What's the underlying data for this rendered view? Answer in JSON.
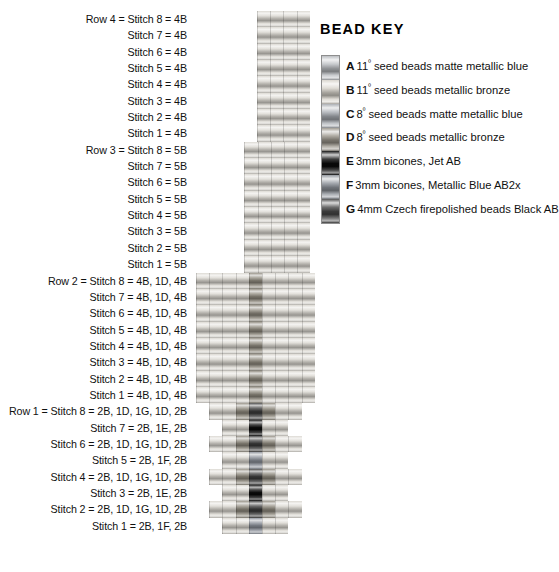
{
  "pattern": {
    "rows": [
      {
        "row_label": "Row 4",
        "stitches": [
          "Row 4 = Stitch 8 = 4B",
          "Stitch 7 = 4B",
          "Stitch 6 = 4B",
          "Stitch 5 = 4B",
          "Stitch 4 = 4B",
          "Stitch 3 = 4B",
          "Stitch 2 = 4B",
          "Stitch 1 = 4B"
        ],
        "cells": [
          [
            "B",
            "B",
            "B",
            "B"
          ],
          [
            "B",
            "B",
            "B",
            "B"
          ],
          [
            "B",
            "B",
            "B",
            "B"
          ],
          [
            "B",
            "B",
            "B",
            "B"
          ],
          [
            "B",
            "B",
            "B",
            "B"
          ],
          [
            "B",
            "B",
            "B",
            "B"
          ],
          [
            "B",
            "B",
            "B",
            "B"
          ],
          [
            "B",
            "B",
            "B",
            "B"
          ]
        ],
        "indent": 28
      },
      {
        "row_label": "Row 3",
        "stitches": [
          "Row 3 = Stitch 8 = 5B",
          "Stitch 7 = 5B",
          "Stitch 6 = 5B",
          "Stitch 5 = 5B",
          "Stitch 4 = 5B",
          "Stitch 3 = 5B",
          "Stitch 2 = 5B",
          "Stitch 1 = 5B"
        ],
        "cells": [
          [
            "B",
            "B",
            "B",
            "B",
            "B"
          ],
          [
            "B",
            "B",
            "B",
            "B",
            "B"
          ],
          [
            "B",
            "B",
            "B",
            "B",
            "B"
          ],
          [
            "B",
            "B",
            "B",
            "B",
            "B"
          ],
          [
            "B",
            "B",
            "B",
            "B",
            "B"
          ],
          [
            "B",
            "B",
            "B",
            "B",
            "B"
          ],
          [
            "B",
            "B",
            "B",
            "B",
            "B"
          ],
          [
            "B",
            "B",
            "B",
            "B",
            "B"
          ]
        ],
        "indent": 22
      },
      {
        "row_label": "Row 2",
        "stitches": [
          "Row 2 = Stitch 8 = 4B, 1D, 4B",
          "Stitch 7 = 4B, 1D, 4B",
          "Stitch 6 = 4B, 1D, 4B",
          "Stitch 5 = 4B, 1D, 4B",
          "Stitch 4 = 4B, 1D, 4B",
          "Stitch 3 = 4B, 1D, 4B",
          "Stitch 2 = 4B, 1D, 4B",
          "Stitch 1 = 4B, 1D, 4B"
        ],
        "cells": [
          [
            "B",
            "B",
            "B",
            "B",
            "D",
            "B",
            "B",
            "B",
            "B"
          ],
          [
            "B",
            "B",
            "B",
            "B",
            "D",
            "B",
            "B",
            "B",
            "B"
          ],
          [
            "B",
            "B",
            "B",
            "B",
            "D",
            "B",
            "B",
            "B",
            "B"
          ],
          [
            "B",
            "B",
            "B",
            "B",
            "D",
            "B",
            "B",
            "B",
            "B"
          ],
          [
            "B",
            "B",
            "B",
            "B",
            "D",
            "B",
            "B",
            "B",
            "B"
          ],
          [
            "B",
            "B",
            "B",
            "B",
            "D",
            "B",
            "B",
            "B",
            "B"
          ],
          [
            "B",
            "B",
            "B",
            "B",
            "D",
            "B",
            "B",
            "B",
            "B"
          ],
          [
            "B",
            "B",
            "B",
            "B",
            "D",
            "B",
            "B",
            "B",
            "B"
          ]
        ],
        "indent": 0
      },
      {
        "row_label": "Row 1",
        "stitches": [
          "Row 1 = Stitch 8 = 2B, 1D, 1G, 1D, 2B",
          "Stitch 7 =  2B, 1E, 2B",
          "Stitch 6 =  2B, 1D, 1G, 1D, 2B",
          "Stitch 5 =  2B, 1F, 2B",
          "Stitch 4 =  2B, 1D, 1G, 1D, 2B",
          "Stitch 3 =  2B, 1E, 2B",
          "Stitch 2 =  2B, 1D, 1G, 1D, 2B",
          "Stitch 1 =  2B, 1F, 2B"
        ],
        "cells": [
          [
            "B",
            "B",
            "D",
            "G",
            "D",
            "B",
            "B"
          ],
          [
            "B",
            "B",
            "E",
            "B",
            "B"
          ],
          [
            "B",
            "B",
            "D",
            "G",
            "D",
            "B",
            "B"
          ],
          [
            "B",
            "B",
            "F",
            "B",
            "B"
          ],
          [
            "B",
            "B",
            "D",
            "G",
            "D",
            "B",
            "B"
          ],
          [
            "B",
            "B",
            "E",
            "B",
            "B"
          ],
          [
            "B",
            "B",
            "D",
            "G",
            "D",
            "B",
            "B"
          ],
          [
            "B",
            "B",
            "F",
            "B",
            "B"
          ]
        ],
        "indent": 0
      }
    ]
  },
  "bead_key": {
    "title": "BEAD KEY",
    "items": [
      {
        "letter": "A",
        "size": "11",
        "sup": "º",
        "text": " seed beads matte metallic blue",
        "color": "#b9bcc0"
      },
      {
        "letter": "B",
        "size": "11",
        "sup": "º",
        "text": " seed beads metallic bronze",
        "color": "#d8d4cc"
      },
      {
        "letter": "C",
        "size": "8",
        "sup": "º",
        "text": " seed beads matte metallic blue",
        "color": "#a8acb2"
      },
      {
        "letter": "D",
        "size": "8",
        "sup": "º",
        "text": " seed beads metallic bronze",
        "color": "#9b968c"
      },
      {
        "letter": "E",
        "size": "",
        "sup": "",
        "text": "3mm bicones, Jet AB",
        "color": "#0b0b0b"
      },
      {
        "letter": "F",
        "size": "",
        "sup": "",
        "text": "3mm bicones, Metallic Blue AB2x",
        "color": "#8f949b"
      },
      {
        "letter": "G",
        "size": "",
        "sup": "",
        "text": "4mm Czech firepolished beads  Black AB",
        "color": "#4a4a4a"
      }
    ]
  },
  "bead_colors": {
    "A": "#b9bcc0",
    "B": "#d9d6cf",
    "C": "#a8acb2",
    "D": "#8f8a7e",
    "E": "#0a0a0a",
    "F": "#8b9099",
    "G": "#3d3d3d"
  }
}
